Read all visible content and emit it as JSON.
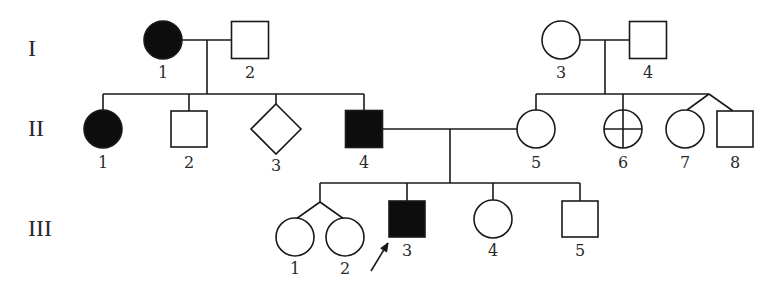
{
  "diagram": {
    "type": "pedigree-chart",
    "colors": {
      "line": "#1a1a1a",
      "affected_fill": "#0d0d0d",
      "unaffected_fill": "#ffffff",
      "text": "#2a2a2a"
    },
    "generations": [
      {
        "id": "I",
        "label": "I",
        "x": 28,
        "y": 50
      },
      {
        "id": "II",
        "label": "II",
        "x": 28,
        "y": 130
      },
      {
        "id": "III",
        "label": "III",
        "x": 28,
        "y": 230
      }
    ],
    "individuals": [
      {
        "id": "I-1",
        "label": "1",
        "generation": "I",
        "sex": "female",
        "shape": "circle",
        "affected": true,
        "cx": 163,
        "cy": 40,
        "size": 38,
        "label_y": 73
      },
      {
        "id": "I-2",
        "label": "2",
        "generation": "I",
        "sex": "male",
        "shape": "square",
        "affected": false,
        "cx": 250,
        "cy": 40,
        "size": 37,
        "label_y": 73
      },
      {
        "id": "I-3",
        "label": "3",
        "generation": "I",
        "sex": "female",
        "shape": "circle",
        "affected": false,
        "cx": 561,
        "cy": 40,
        "size": 38,
        "label_y": 73
      },
      {
        "id": "I-4",
        "label": "4",
        "generation": "I",
        "sex": "male",
        "shape": "square",
        "affected": false,
        "cx": 648,
        "cy": 40,
        "size": 37,
        "label_y": 73
      },
      {
        "id": "II-1",
        "label": "1",
        "generation": "II",
        "sex": "female",
        "shape": "circle",
        "affected": true,
        "cx": 103,
        "cy": 129,
        "size": 38,
        "label_y": 163
      },
      {
        "id": "II-2",
        "label": "2",
        "generation": "II",
        "sex": "male",
        "shape": "square",
        "affected": false,
        "cx": 189,
        "cy": 129,
        "size": 36,
        "label_y": 163
      },
      {
        "id": "II-3",
        "label": "3",
        "generation": "II",
        "sex": "unknown",
        "shape": "diamond",
        "affected": false,
        "cx": 276,
        "cy": 129,
        "size": 50,
        "label_y": 166
      },
      {
        "id": "II-4",
        "label": "4",
        "generation": "II",
        "sex": "male",
        "shape": "square",
        "affected": true,
        "cx": 364,
        "cy": 129,
        "size": 37,
        "label_y": 163
      },
      {
        "id": "II-5",
        "label": "5",
        "generation": "II",
        "sex": "female",
        "shape": "circle",
        "affected": false,
        "cx": 536,
        "cy": 129,
        "size": 38,
        "label_y": 163
      },
      {
        "id": "II-6",
        "label": "6",
        "generation": "II",
        "sex": "female",
        "shape": "circle-cross",
        "affected": false,
        "cx": 623,
        "cy": 129,
        "size": 38,
        "label_y": 163
      },
      {
        "id": "II-7",
        "label": "7",
        "generation": "II",
        "sex": "female",
        "shape": "circle",
        "affected": false,
        "cx": 685,
        "cy": 129,
        "size": 38,
        "label_y": 163
      },
      {
        "id": "II-8",
        "label": "8",
        "generation": "II",
        "sex": "male",
        "shape": "square",
        "affected": false,
        "cx": 735,
        "cy": 129,
        "size": 36,
        "label_y": 163
      },
      {
        "id": "III-1",
        "label": "1",
        "generation": "III",
        "sex": "female",
        "shape": "circle",
        "affected": false,
        "cx": 295,
        "cy": 237,
        "size": 38,
        "label_y": 269
      },
      {
        "id": "III-2",
        "label": "2",
        "generation": "III",
        "sex": "female",
        "shape": "circle",
        "affected": false,
        "cx": 345,
        "cy": 237,
        "size": 38,
        "label_y": 269
      },
      {
        "id": "III-3",
        "label": "3",
        "generation": "III",
        "sex": "male",
        "shape": "square",
        "affected": true,
        "proband": true,
        "cx": 407,
        "cy": 219,
        "size": 36,
        "label_y": 251
      },
      {
        "id": "III-4",
        "label": "4",
        "generation": "III",
        "sex": "female",
        "shape": "circle",
        "affected": false,
        "cx": 493,
        "cy": 219,
        "size": 38,
        "label_y": 251
      },
      {
        "id": "III-5",
        "label": "5",
        "generation": "III",
        "sex": "male",
        "shape": "square",
        "affected": false,
        "cx": 580,
        "cy": 219,
        "size": 36,
        "label_y": 251
      }
    ],
    "lines": [
      {
        "name": "mating-line-I1-I2",
        "x1": 182,
        "y1": 40,
        "x2": 231,
        "y2": 40
      },
      {
        "name": "descent-line-I1-I2",
        "x1": 207,
        "y1": 40,
        "x2": 207,
        "y2": 94
      },
      {
        "name": "sibship-line-II-left",
        "x1": 103,
        "y1": 94,
        "x2": 364,
        "y2": 94
      },
      {
        "name": "sib-drop-II1",
        "x1": 103,
        "y1": 94,
        "x2": 103,
        "y2": 110
      },
      {
        "name": "sib-drop-II2",
        "x1": 189,
        "y1": 94,
        "x2": 189,
        "y2": 111
      },
      {
        "name": "sib-drop-II3",
        "x1": 276,
        "y1": 94,
        "x2": 276,
        "y2": 104
      },
      {
        "name": "sib-drop-II4",
        "x1": 364,
        "y1": 94,
        "x2": 364,
        "y2": 111
      },
      {
        "name": "mating-line-I3-I4",
        "x1": 580,
        "y1": 40,
        "x2": 629,
        "y2": 40
      },
      {
        "name": "descent-line-I3-I4",
        "x1": 605,
        "y1": 40,
        "x2": 605,
        "y2": 94
      },
      {
        "name": "sibship-line-II-right",
        "x1": 536,
        "y1": 94,
        "x2": 709,
        "y2": 94
      },
      {
        "name": "sib-drop-II5",
        "x1": 536,
        "y1": 94,
        "x2": 536,
        "y2": 110
      },
      {
        "name": "sib-drop-II6",
        "x1": 623,
        "y1": 94,
        "x2": 623,
        "y2": 110
      },
      {
        "name": "twin-line-II7",
        "x1": 709,
        "y1": 94,
        "x2": 687,
        "y2": 110
      },
      {
        "name": "twin-line-II8",
        "x1": 709,
        "y1": 94,
        "x2": 733,
        "y2": 111
      },
      {
        "name": "mating-line-II4-II5",
        "x1": 382,
        "y1": 129,
        "x2": 517,
        "y2": 129
      },
      {
        "name": "descent-line-II4-II5",
        "x1": 450,
        "y1": 129,
        "x2": 450,
        "y2": 183
      },
      {
        "name": "sibship-line-III",
        "x1": 320,
        "y1": 183,
        "x2": 580,
        "y2": 183
      },
      {
        "name": "twin-drop-III",
        "x1": 320,
        "y1": 183,
        "x2": 320,
        "y2": 202
      },
      {
        "name": "twin-line-III1",
        "x1": 320,
        "y1": 202,
        "x2": 296,
        "y2": 219
      },
      {
        "name": "twin-line-III2",
        "x1": 320,
        "y1": 202,
        "x2": 344,
        "y2": 219
      },
      {
        "name": "sib-drop-III3",
        "x1": 407,
        "y1": 183,
        "x2": 407,
        "y2": 201
      },
      {
        "name": "sib-drop-III4",
        "x1": 493,
        "y1": 183,
        "x2": 493,
        "y2": 200
      },
      {
        "name": "sib-drop-III5",
        "x1": 580,
        "y1": 183,
        "x2": 580,
        "y2": 201
      }
    ],
    "proband_arrow": {
      "target": "III-3",
      "x1": 371,
      "y1": 271,
      "x2": 388,
      "y2": 243
    }
  }
}
